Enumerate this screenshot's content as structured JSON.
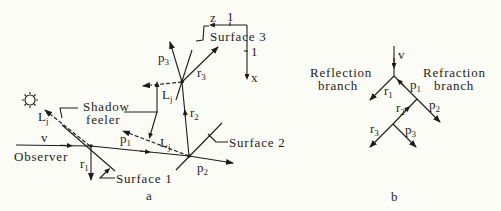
{
  "figure": {
    "panel_a": {
      "caption": "a",
      "labels": {
        "observer": "Observer",
        "v": "v",
        "shadow_feeler_line1": "Shadow",
        "shadow_feeler_line2": "feeler",
        "surface1": "Surface 1",
        "surface2": "Surface 2",
        "surface3": "Surface 3",
        "L": "L",
        "L_sub": "j",
        "r1": "r",
        "r1_sub": "1",
        "r2": "r",
        "r2_sub": "2",
        "r3": "r",
        "r3_sub": "3",
        "p1": "p",
        "p1_sub": "1",
        "p2": "p",
        "p2_sub": "2",
        "p3": "p",
        "p3_sub": "3"
      },
      "axes": {
        "z_label": "z",
        "x_label": "x",
        "scale_h": "1",
        "scale_v": "1"
      },
      "light_source": "sun-icon"
    },
    "panel_b": {
      "caption": "b",
      "labels": {
        "v": "v",
        "reflection_line1": "Reflection",
        "reflection_line2": "branch",
        "refraction_line1": "Refraction",
        "refraction_line2": "branch",
        "r1": "r",
        "r1_sub": "1",
        "r2": "r",
        "r2_sub": "2",
        "r3": "r",
        "r3_sub": "3",
        "p1": "p",
        "p1_sub": "1",
        "p2": "p",
        "p2_sub": "2",
        "p3": "p",
        "p3_sub": "3"
      }
    },
    "colors": {
      "background": "#fcfcf7",
      "ink": "#1c1c1c"
    }
  }
}
